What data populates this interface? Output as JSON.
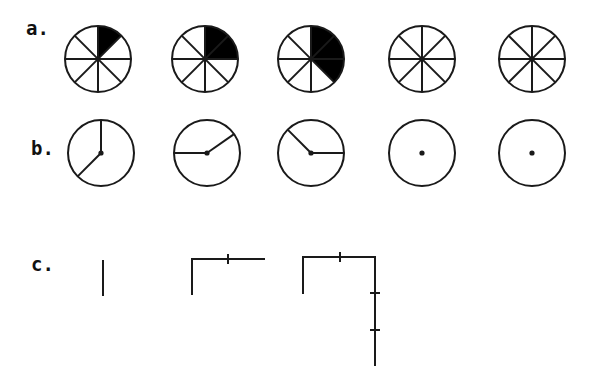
{
  "figure": {
    "stroke_color": "#1a1a1a",
    "fill_color": "#000000",
    "background": "#ffffff",
    "rows": [
      {
        "label": "a.",
        "description": "Circles divided into 8 equal sectors, progressively shaded clockwise from 12 o'clock",
        "items": [
          {
            "shaded_sectors": 1
          },
          {
            "shaded_sectors": 2
          },
          {
            "shaded_sectors": 3
          },
          {
            "shaded_sectors": 0
          },
          {
            "shaded_sectors": 0
          }
        ]
      },
      {
        "label": "b.",
        "description": "Circles with two radii forming angles; last two show only a center dot",
        "items": [
          {
            "radii_angles_deg": [
              0,
              225
            ]
          },
          {
            "radii_angles_deg": [
              270,
              55
            ]
          },
          {
            "radii_angles_deg": [
              315,
              90
            ]
          },
          {
            "radii_angles_deg": []
          },
          {
            "radii_angles_deg": []
          }
        ]
      },
      {
        "label": "c.",
        "description": "Growing path of line segments joined at right angles, with tick marks at segment joins",
        "items": [
          {
            "segments": 1
          },
          {
            "segments": 3
          },
          {
            "segments": 6
          }
        ]
      }
    ]
  }
}
